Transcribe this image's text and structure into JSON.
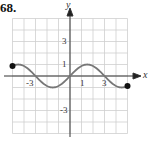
{
  "problem_number": "68.",
  "chart_data": {
    "type": "line",
    "title": "",
    "xlabel": "x",
    "ylabel": "y",
    "xlim": [
      -5,
      5
    ],
    "ylim": [
      -5,
      5
    ],
    "grid": true,
    "x_tick_labels": [
      "-3",
      "1",
      "3"
    ],
    "y_tick_labels": [
      "3",
      "1",
      "-3"
    ],
    "series": [
      {
        "name": "f(x)",
        "description": "sine-like curve from closed point (-5, 1) to closed point (5, -1), crossing zero at -3, 0, 3; max 1 near x=1.5, min -1 near x=-1.5",
        "x": [
          -5,
          -4,
          -3,
          -2,
          -1.5,
          -1,
          0,
          1,
          1.5,
          2,
          3,
          4,
          5
        ],
        "y": [
          1,
          0.7,
          0,
          -0.7,
          -1,
          -0.85,
          0,
          0.85,
          1,
          0.85,
          0,
          -0.7,
          -1
        ]
      }
    ],
    "endpoints": [
      {
        "x": -5,
        "y": 1,
        "style": "closed"
      },
      {
        "x": 5,
        "y": -1,
        "style": "closed"
      }
    ]
  }
}
